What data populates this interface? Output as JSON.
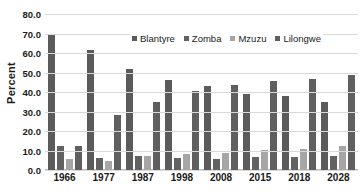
{
  "chart_data": {
    "type": "bar",
    "title": "",
    "subtitle": "",
    "xlabel": "",
    "ylabel": "Percent",
    "categories": [
      "1966",
      "1977",
      "1987",
      "1998",
      "2008",
      "2015",
      "2018",
      "2028"
    ],
    "series": [
      {
        "name": "Blantyre",
        "color": "#5b5b5b",
        "values": [
          69.5,
          61.5,
          52.0,
          46.0,
          43.0,
          39.2,
          38.0,
          34.7
        ]
      },
      {
        "name": "Zomba",
        "color": "#626262",
        "values": [
          12.3,
          6.1,
          7.0,
          6.3,
          5.9,
          6.8,
          6.9,
          7.2
        ]
      },
      {
        "name": "Mzuzu",
        "color": "#a6a6a6",
        "values": [
          5.4,
          4.5,
          7.3,
          8.4,
          8.9,
          10.3,
          10.8,
          12.1
        ]
      },
      {
        "name": "Lilongwe",
        "color": "#5f5f5f",
        "values": [
          12.3,
          28.4,
          34.8,
          40.5,
          43.4,
          45.6,
          46.5,
          48.5
        ]
      }
    ],
    "ylim": [
      0,
      80
    ],
    "ytick_step": 10,
    "yticks": [
      "80.0",
      "70.0",
      "60.0",
      "50.0",
      "40.0",
      "30.0",
      "20.0",
      "10.0",
      "0.0"
    ],
    "grid": true,
    "legend_position": "top-center-inside"
  }
}
